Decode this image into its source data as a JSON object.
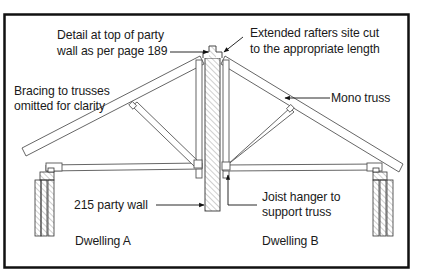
{
  "diagram": {
    "type": "section-drawing",
    "colors": {
      "frame": "#111111",
      "line": "#555555",
      "text": "#1a1a1a",
      "hatch": "#777777",
      "background": "#ffffff"
    },
    "labels": {
      "detail_top": {
        "line1": "Detail at top of party",
        "line2": "wall as per page 189"
      },
      "extended_rafters": {
        "line1": "Extended rafters site cut",
        "line2": "to the appropriate length"
      },
      "bracing": {
        "line1": "Bracing to trusses",
        "line2": "omitted for clarity"
      },
      "mono_truss": "Mono truss",
      "party_wall": "215 party wall",
      "joist_hanger": {
        "line1": "Joist hanger to",
        "line2": "support truss"
      },
      "dwelling_a": "Dwelling A",
      "dwelling_b": "Dwelling B"
    }
  }
}
